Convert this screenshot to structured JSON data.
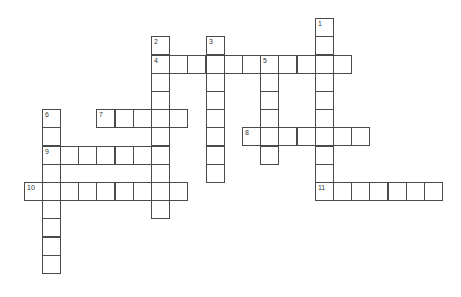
{
  "puzzle": {
    "type": "crossword",
    "grid": {
      "origin_x": 151,
      "origin_y": 54.5,
      "cell_size": 18.2
    },
    "entries": [
      {
        "number": "1",
        "direction": "down",
        "col": 9,
        "row": -2,
        "length": 10
      },
      {
        "number": "2",
        "direction": "down",
        "col": 0,
        "row": -1,
        "length": 10
      },
      {
        "number": "3",
        "direction": "down",
        "col": 3,
        "row": -1,
        "length": 8
      },
      {
        "number": "4",
        "direction": "across",
        "col": 0,
        "row": 0,
        "length": 11
      },
      {
        "number": "5",
        "direction": "down",
        "col": 6,
        "row": 0,
        "length": 6
      },
      {
        "number": "6",
        "direction": "down",
        "col": -6,
        "row": 3,
        "length": 9
      },
      {
        "number": "7",
        "direction": "across",
        "col": -3,
        "row": 3,
        "length": 5
      },
      {
        "number": "8",
        "direction": "across",
        "col": 5,
        "row": 4,
        "length": 7
      },
      {
        "number": "9",
        "direction": "across",
        "col": -6,
        "row": 5,
        "length": 7
      },
      {
        "number": "10",
        "direction": "across",
        "col": -7,
        "row": 7,
        "length": 9
      },
      {
        "number": "11",
        "direction": "across",
        "col": 9,
        "row": 7,
        "length": 7
      }
    ]
  }
}
